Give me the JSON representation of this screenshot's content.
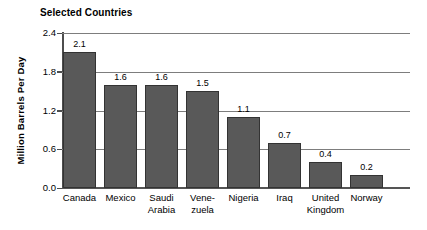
{
  "chart_data": {
    "type": "bar",
    "title": "Selected Countries",
    "xlabel": "",
    "ylabel": "Million Barrels Per Day",
    "categories": [
      "Canada",
      "Mexico",
      "Saudi Arabia",
      "Venezuela",
      "Nigeria",
      "Iraq",
      "United Kingdom",
      "Norway"
    ],
    "category_label_lines": [
      [
        "Canada"
      ],
      [
        "Mexico"
      ],
      [
        "Saudi",
        "Arabia"
      ],
      [
        "Vene-",
        "zuela"
      ],
      [
        "Nigeria"
      ],
      [
        "Iraq"
      ],
      [
        "United",
        "Kingdom"
      ],
      [
        "Norway"
      ]
    ],
    "values": [
      2.1,
      1.6,
      1.6,
      1.5,
      1.1,
      0.7,
      0.4,
      0.2
    ],
    "value_labels": [
      "2.1",
      "1.6",
      "1.6",
      "1.5",
      "1.1",
      "0.7",
      "0.4",
      "0.2"
    ],
    "ylim": [
      0.0,
      2.4
    ],
    "ytick_values": [
      0.0,
      0.6,
      1.2,
      1.8,
      2.4
    ],
    "ytick_labels": [
      "0.0",
      "0.6",
      "1.2",
      "1.8",
      "2.4"
    ],
    "grid": true,
    "grid_axis": "y",
    "legend": false,
    "legend_position": "none",
    "colors": {
      "bar_fill": "#595959",
      "bar_border": "#333333",
      "gridline": "#7d7d7d",
      "axis": "#4d4d4d",
      "background": "#ffffff",
      "text": "#000000"
    }
  }
}
